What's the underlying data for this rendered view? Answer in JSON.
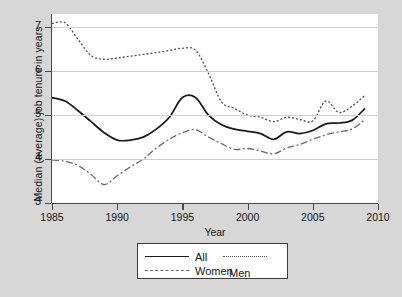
{
  "chart_data": {
    "type": "line",
    "title": "",
    "xlabel": "Year",
    "ylabel": "Median (average) job tenure in years",
    "xlim": [
      1985,
      2010
    ],
    "ylim": [
      3,
      7.3
    ],
    "xticks": [
      1985,
      1990,
      1995,
      2000,
      2005,
      2010
    ],
    "yticks": [
      3,
      4,
      5,
      6,
      7
    ],
    "grid": true,
    "legend_position": "below-axis",
    "x": [
      1985,
      1986,
      1987,
      1988,
      1989,
      1990,
      1991,
      1992,
      1993,
      1994,
      1995,
      1996,
      1997,
      1998,
      1999,
      2000,
      2001,
      2002,
      2003,
      2004,
      2005,
      2006,
      2007,
      2008,
      2009
    ],
    "series": [
      {
        "name": "All",
        "style": "solid",
        "color": "#1a1a1a",
        "values": [
          5.4,
          5.32,
          5.1,
          4.85,
          4.6,
          4.43,
          4.43,
          4.5,
          4.68,
          4.95,
          5.4,
          5.4,
          5.0,
          4.78,
          4.68,
          4.63,
          4.58,
          4.45,
          4.62,
          4.58,
          4.65,
          4.8,
          4.82,
          4.88,
          5.15
        ]
      },
      {
        "name": "Men",
        "style": "dotted",
        "color": "#4f4f4f",
        "values": [
          7.08,
          7.1,
          6.72,
          6.35,
          6.27,
          6.3,
          6.34,
          6.38,
          6.42,
          6.47,
          6.52,
          6.48,
          5.95,
          5.3,
          5.15,
          5.0,
          4.95,
          4.85,
          4.95,
          4.9,
          4.87,
          5.32,
          5.06,
          5.2,
          5.45
        ]
      },
      {
        "name": "Women",
        "style": "dashdot",
        "color": "#6a6a6a",
        "values": [
          3.98,
          3.95,
          3.85,
          3.65,
          3.42,
          3.62,
          3.82,
          4.0,
          4.25,
          4.45,
          4.6,
          4.67,
          4.5,
          4.35,
          4.22,
          4.24,
          4.18,
          4.12,
          4.25,
          4.33,
          4.45,
          4.55,
          4.62,
          4.68,
          4.9
        ]
      }
    ]
  },
  "legend": {
    "items": [
      {
        "label": "All"
      },
      {
        "label": "Men"
      },
      {
        "label": "Women"
      }
    ]
  }
}
